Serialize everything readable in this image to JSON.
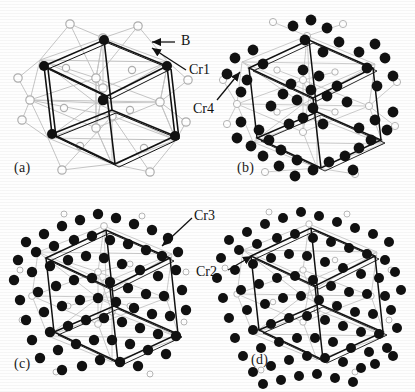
{
  "figure": {
    "type": "crystal-structure-figure",
    "background_color": "#fefefe",
    "atom_colors": {
      "filled": "#111111",
      "open_stroke": "#b9b9b9",
      "bond_stroke": "#c2c2c2",
      "cell_stroke": "#111111"
    },
    "panels": [
      {
        "id": "a",
        "label": "(a)",
        "description": "unit cell with Cr1 corner sites and B open sites",
        "filled_atom_count": 6,
        "open_atom_count": 28,
        "callouts": [
          {
            "text": "B",
            "arrow": "left"
          },
          {
            "text": "Cr1",
            "arrow": "left-up"
          }
        ]
      },
      {
        "id": "b",
        "label": "(b)",
        "description": "unit cell with Cr4 sites added",
        "filled_atom_count": 52,
        "open_atom_count": 34,
        "callouts": [
          {
            "text": "Cr4",
            "arrow": "up-right"
          }
        ]
      },
      {
        "id": "c",
        "label": "(c)",
        "description": "unit cell with Cr3 sites added",
        "filled_atom_count": 72,
        "open_atom_count": 40,
        "callouts": [
          {
            "text": "Cr3",
            "arrow": "down-left"
          }
        ]
      },
      {
        "id": "d",
        "label": "(d)",
        "description": "unit cell with Cr2 sites added, full structure",
        "filled_atom_count": 88,
        "open_atom_count": 48,
        "callouts": [
          {
            "text": "Cr2",
            "arrow": "up-right"
          }
        ]
      }
    ],
    "labels": {
      "panel_a": "(a)",
      "panel_b": "(b)",
      "panel_c": "(c)",
      "panel_d": "(d)",
      "site_b": "B",
      "site_cr1": "Cr1",
      "site_cr4": "Cr4",
      "site_cr3": "Cr3",
      "site_cr2": "Cr2"
    }
  }
}
